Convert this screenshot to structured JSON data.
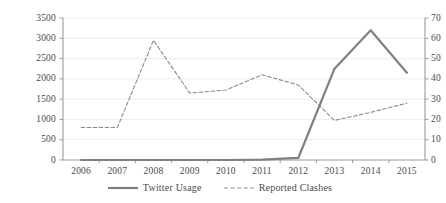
{
  "chart_data": {
    "type": "line",
    "title": "",
    "xlabel": "",
    "categories": [
      "2006",
      "2007",
      "2008",
      "2009",
      "2010",
      "2011",
      "2012",
      "2013",
      "2014",
      "2015"
    ],
    "grid": true,
    "legend_position": "bottom-center",
    "series": [
      {
        "name": "Twitter Usage",
        "axis": "left",
        "style": "solid",
        "color": "#808080",
        "values": [
          0,
          0,
          0,
          0,
          0,
          10,
          50,
          2250,
          3200,
          2150
        ]
      },
      {
        "name": "Reported Clashes",
        "axis": "right",
        "style": "dashed",
        "color": "#8a8a8a",
        "values": [
          16,
          16,
          59,
          33,
          34.5,
          42,
          37,
          19.5,
          23.5,
          28
        ]
      }
    ],
    "axes": {
      "left": {
        "label": "",
        "ylim": [
          0,
          3500
        ],
        "ticks": [
          "0",
          "500",
          "1000",
          "1500",
          "2000",
          "2500",
          "3000",
          "3500"
        ],
        "tick_values": [
          0,
          500,
          1000,
          1500,
          2000,
          2500,
          3000,
          3500
        ]
      },
      "right": {
        "label": "",
        "ylim": [
          0,
          70
        ],
        "ticks": [
          "0",
          "10",
          "20",
          "30",
          "40",
          "50",
          "60",
          "70"
        ],
        "tick_values": [
          0,
          10,
          20,
          30,
          40,
          50,
          60,
          70
        ]
      }
    }
  },
  "legend": {
    "items": [
      {
        "label": "Twitter Usage",
        "style": "solid"
      },
      {
        "label": "Reported Clashes",
        "style": "dashed"
      }
    ]
  },
  "colors": {
    "series_solid": "#808080",
    "series_dashed": "#8a8a8a",
    "axis": "#9a9a9a",
    "grid": "#ededed",
    "text": "#4a4a4a",
    "background": "#ffffff"
  }
}
